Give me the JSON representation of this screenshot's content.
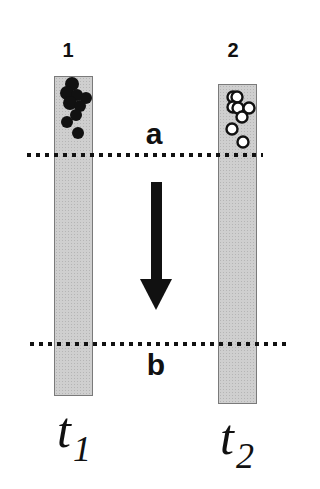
{
  "diagram": {
    "columns": [
      {
        "id": "1",
        "label": "1",
        "time_label": "t",
        "time_sub": "1",
        "particle_style": "filled"
      },
      {
        "id": "2",
        "label": "2",
        "time_label": "t",
        "time_sub": "2",
        "particle_style": "hollow"
      }
    ],
    "lines": [
      {
        "id": "a",
        "label": "a",
        "style": "dotted"
      },
      {
        "id": "b",
        "label": "b",
        "style": "dotted"
      }
    ],
    "arrow": {
      "direction": "down",
      "from": "a",
      "to": "b"
    },
    "colors": {
      "column_fill": "#cfcfcf",
      "column_border": "#7a7a7a",
      "ink": "#111111",
      "background": "#ffffff"
    }
  }
}
